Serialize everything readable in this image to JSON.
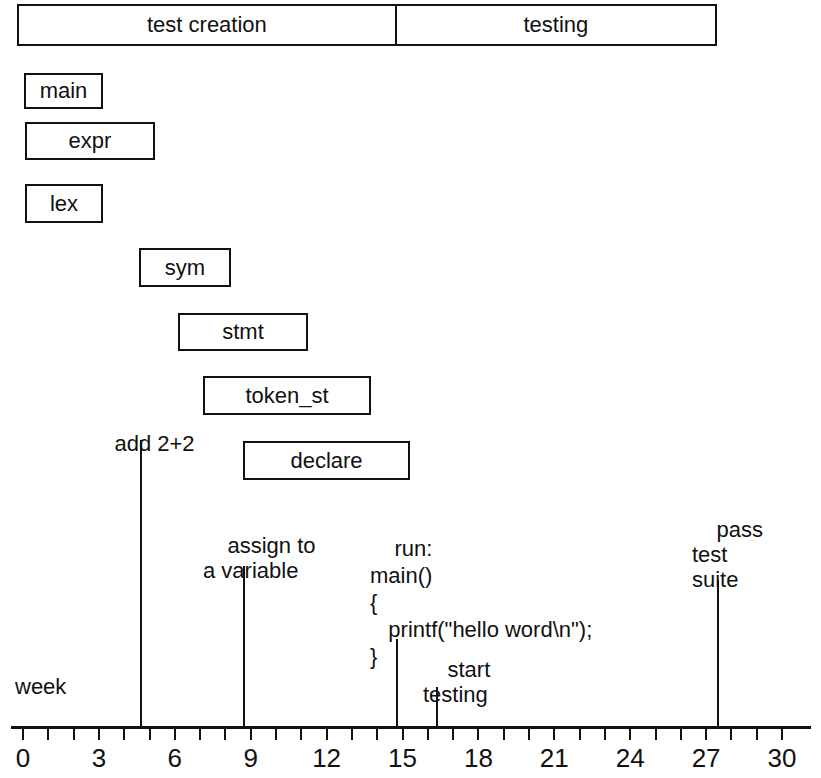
{
  "figure": {
    "kind": "gantt-schedule-diagram",
    "axis_title": "week"
  },
  "chart_data": {
    "type": "bar",
    "title": "",
    "xlabel": "week",
    "ylabel": "",
    "xlim": [
      0,
      30
    ],
    "grid": false,
    "legend": null,
    "orientation": "horizontal",
    "phases": [
      {
        "label": "test creation",
        "start": 0,
        "end": 14.7
      },
      {
        "label": "testing",
        "start": 14.7,
        "end": 27.5
      }
    ],
    "tasks": [
      {
        "label": "main",
        "start": 0.0,
        "end": 3.2
      },
      {
        "label": "expr",
        "start": 0.1,
        "end": 5.2
      },
      {
        "label": "lex",
        "start": 0.1,
        "end": 3.2
      },
      {
        "label": "sym",
        "start": 4.6,
        "end": 8.2
      },
      {
        "label": "stmt",
        "start": 6.1,
        "end": 11.2
      },
      {
        "label": "token_st",
        "start": 7.1,
        "end": 13.7
      },
      {
        "label": "declare",
        "start": 8.7,
        "end": 15.3
      }
    ],
    "milestones": [
      {
        "label": "add 2+2",
        "week": 4.6
      },
      {
        "label": "assign to\na variable",
        "week": 8.7
      },
      {
        "label": "run:\nmain()\n{\n  printf(\"hello word\\n\");\n}",
        "week": 14.8
      },
      {
        "label": "start\ntesting",
        "week": 16.3
      },
      {
        "label": "pass\ntest\nsuite",
        "week": 27.0
      }
    ],
    "tick_values": [
      0,
      1,
      2,
      3,
      4,
      5,
      6,
      7,
      8,
      9,
      10,
      11,
      12,
      13,
      14,
      15,
      16,
      17,
      18,
      19,
      20,
      21,
      22,
      23,
      24,
      25,
      26,
      27,
      28,
      29,
      30
    ],
    "labeled_ticks": [
      0,
      3,
      6,
      9,
      12,
      15,
      18,
      21,
      24,
      27,
      30
    ],
    "tick_labels": [
      "0",
      "3",
      "6",
      "9",
      "12",
      "15",
      "18",
      "21",
      "24",
      "27",
      "30"
    ]
  },
  "phase_bar": {
    "segments": [
      {
        "label": "test creation"
      },
      {
        "label": "testing"
      }
    ]
  },
  "tasks": [
    {
      "label": "main"
    },
    {
      "label": "expr"
    },
    {
      "label": "lex"
    },
    {
      "label": "sym"
    },
    {
      "label": "stmt"
    },
    {
      "label": "token_st"
    },
    {
      "label": "declare"
    }
  ],
  "annotations": {
    "add_2_plus_2": "add 2+2",
    "assign_to_a_variable": "assign to\na variable",
    "code_block": "run:\nmain()\n{\n   printf(\"hello word\\n\");\n}",
    "start_testing": "start\ntesting",
    "pass_test_suite": "pass\ntest\nsuite"
  },
  "axis": {
    "title": "week",
    "tick_labels": [
      "0",
      "3",
      "6",
      "9",
      "12",
      "15",
      "18",
      "21",
      "24",
      "27",
      "30"
    ]
  },
  "colors": {
    "ink": "#111111",
    "paper": "#ffffff"
  }
}
